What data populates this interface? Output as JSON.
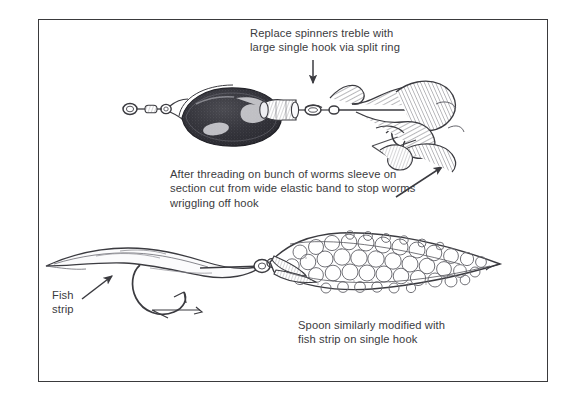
{
  "figure": {
    "background_color": "#ffffff",
    "border_color": "#3a3a3c",
    "ink_color": "#3b3b40"
  },
  "captions": {
    "spinner_hook": "Replace spinners treble with\nlarge single hook via split ring",
    "worm_sleeve": "After threading on bunch of worms sleeve on\nsection cut from wide elastic band to stop worms\nwriggling off hook",
    "spoon": "Spoon similarly modified with\nfish strip on single hook",
    "fish_strip": "Fish\nstrip"
  },
  "annotations": {
    "arrow_down_to_split_ring": "arrow-down-icon",
    "arrow_up_right_to_worms": "arrow-up-right-icon",
    "arrow_up_right_to_strip": "arrow-up-right-icon"
  },
  "parts": {
    "spinner_blade": "spinner-blade",
    "spinner_swivel": "swivel",
    "spinner_body": "spinner-body-bead",
    "split_ring": "split-ring",
    "worm_bunch": "worm-bunch",
    "single_hook_top": "large-single-hook",
    "spoon_lure": "spoon-lure",
    "spoon_scales": "scale-pattern",
    "spoon_eye": "spoon-eye-ring",
    "fish_strip": "fish-strip-bait",
    "single_hook_bottom": "large-single-hook"
  }
}
